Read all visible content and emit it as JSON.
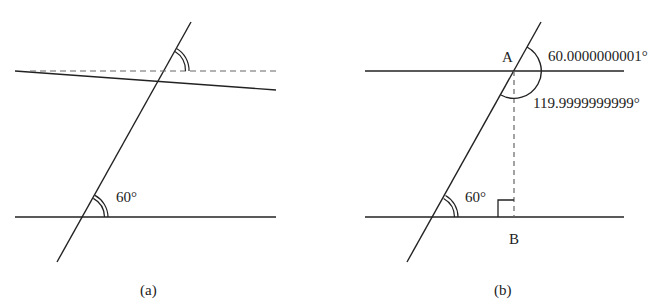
{
  "figure_a": {
    "caption": "(a)",
    "angle_label": "60°",
    "elements": [
      "transversal",
      "bottom-line",
      "slanted-line",
      "dashed-reference-line",
      "top-angle-arc",
      "bottom-angle-arc"
    ]
  },
  "figure_b": {
    "caption": "(b)",
    "point_a": "A",
    "point_b": "B",
    "angle_bottom_label": "60°",
    "angle_top_right_label": "60.0000000001°",
    "angle_bottom_right_label": "119.9999999999°",
    "elements": [
      "transversal",
      "top-line",
      "bottom-line",
      "perpendicular-dashed",
      "right-angle-marker",
      "angle-arcs"
    ]
  },
  "colors": {
    "stroke": "#222222",
    "dashed": "#666666",
    "background": "#ffffff"
  }
}
